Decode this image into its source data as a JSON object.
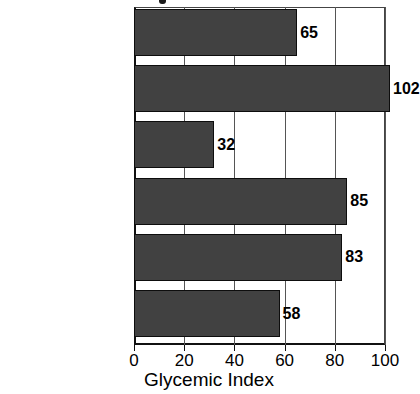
{
  "chart_data": {
    "type": "bar",
    "orientation": "horizontal",
    "title": "",
    "xlabel": "Glycemic Index",
    "ylabel": "",
    "xlim": [
      0,
      100
    ],
    "xticks": [
      0,
      20,
      40,
      60,
      80,
      100
    ],
    "grid": true,
    "legend": false,
    "bar_color": "#414141",
    "categories": [
      "Table Sugar (sucrose)",
      "Glucose",
      "Pasta (fettuccine)",
      "Potato (baked)",
      "White Rice (boiled)",
      "Basmati Rice"
    ],
    "values": [
      65,
      102,
      32,
      85,
      83,
      58
    ],
    "data_labels": [
      "65",
      "102",
      "32",
      "85",
      "83",
      "58"
    ],
    "tick_labels": [
      "0",
      "20",
      "40",
      "60",
      "80",
      "100"
    ]
  }
}
